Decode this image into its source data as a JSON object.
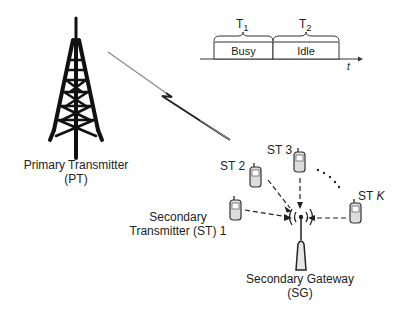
{
  "diagram": {
    "primary_transmitter": {
      "line1": "Primary Transmitter",
      "line2": "(PT)"
    },
    "secondary_gateway": {
      "line1": "Secondary Gateway",
      "line2": "(SG)"
    },
    "secondary_transmitters": [
      {
        "label_line1": "Secondary",
        "label_line2": "Transmitter (ST) 1"
      },
      {
        "label": "ST 2"
      },
      {
        "label": "ST 3"
      },
      {
        "label_prefix": "ST ",
        "label_var": "K"
      }
    ],
    "timeline": {
      "periods": [
        {
          "name": "T",
          "subscript": "1",
          "state": "Busy"
        },
        {
          "name": "T",
          "subscript": "2",
          "state": "Idle"
        }
      ],
      "axis_label": "t"
    },
    "ellipsis": "• • • •"
  }
}
